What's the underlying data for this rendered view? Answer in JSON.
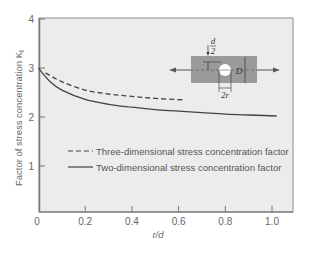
{
  "chart_data": {
    "type": "line",
    "title": "",
    "xlabel": "r/d",
    "ylabel": "Factor of stress concentration K",
    "ylabel_subscript": "t",
    "xlim": [
      0,
      1.0
    ],
    "ylim": [
      0,
      4
    ],
    "xticks": [
      0,
      0.2,
      0.4,
      0.6,
      0.8,
      1.0
    ],
    "xtick_labels": [
      "0",
      "0.2",
      "0.4",
      "0.6",
      "0.8",
      "1.0"
    ],
    "yticks": [
      1,
      2,
      3,
      4
    ],
    "ytick_labels": [
      "1",
      "2",
      "3",
      "4"
    ],
    "grid": false,
    "legend_position": "center-left inside plot",
    "series": [
      {
        "name": "Three-dimensional stress concentration factor",
        "style": "dashed",
        "x": [
          0.03,
          0.1,
          0.2,
          0.3,
          0.4,
          0.5,
          0.62
        ],
        "values": [
          2.9,
          2.72,
          2.55,
          2.47,
          2.42,
          2.38,
          2.35
        ]
      },
      {
        "name": "Two-dimensional stress concentration factor",
        "style": "solid",
        "x": [
          0,
          0.05,
          0.1,
          0.2,
          0.3,
          0.4,
          0.5,
          0.6,
          0.7,
          0.8,
          0.9,
          1.02
        ],
        "values": [
          3.0,
          2.72,
          2.55,
          2.36,
          2.26,
          2.2,
          2.15,
          2.12,
          2.09,
          2.06,
          2.04,
          2.02
        ]
      }
    ],
    "inset": {
      "description": "Plate of width D with central hole of radius r, loaded in tension",
      "labels": {
        "half_d_num": "d",
        "half_d_den": "2",
        "width": "D",
        "hole": "2r"
      }
    }
  },
  "colors": {
    "plot_background": "#ececec",
    "axis": "#8a8a8a",
    "curve": "#444444",
    "inset_plate": "#9a9a9a"
  }
}
